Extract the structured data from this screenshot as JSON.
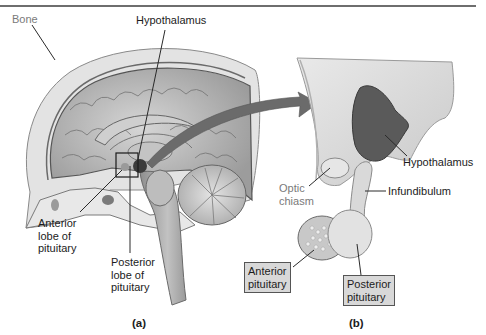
{
  "figure": {
    "panel_a": {
      "caption": "(a)",
      "labels": {
        "bone": "Bone",
        "hypothalamus": "Hypothalamus",
        "anterior_lobe": [
          "Anterior",
          "lobe of",
          "pituitary"
        ],
        "posterior_lobe": [
          "Posterior",
          "lobe of",
          "pituitary"
        ]
      }
    },
    "panel_b": {
      "caption": "(b)",
      "labels": {
        "hypothalamus": "Hypothalamus",
        "optic_chiasm": [
          "Optic",
          "chiasm"
        ],
        "infundibulum": "Infundibulum",
        "anterior_pituitary": [
          "Anterior",
          "pituitary"
        ],
        "posterior_pituitary": [
          "Posterior",
          "pituitary"
        ]
      }
    },
    "colors": {
      "brain": "#b9b9b9",
      "hypothalamus_dark": "#5a5a5a",
      "arrow": "#6b6b6b",
      "label_box": "#d8d8d8"
    }
  }
}
